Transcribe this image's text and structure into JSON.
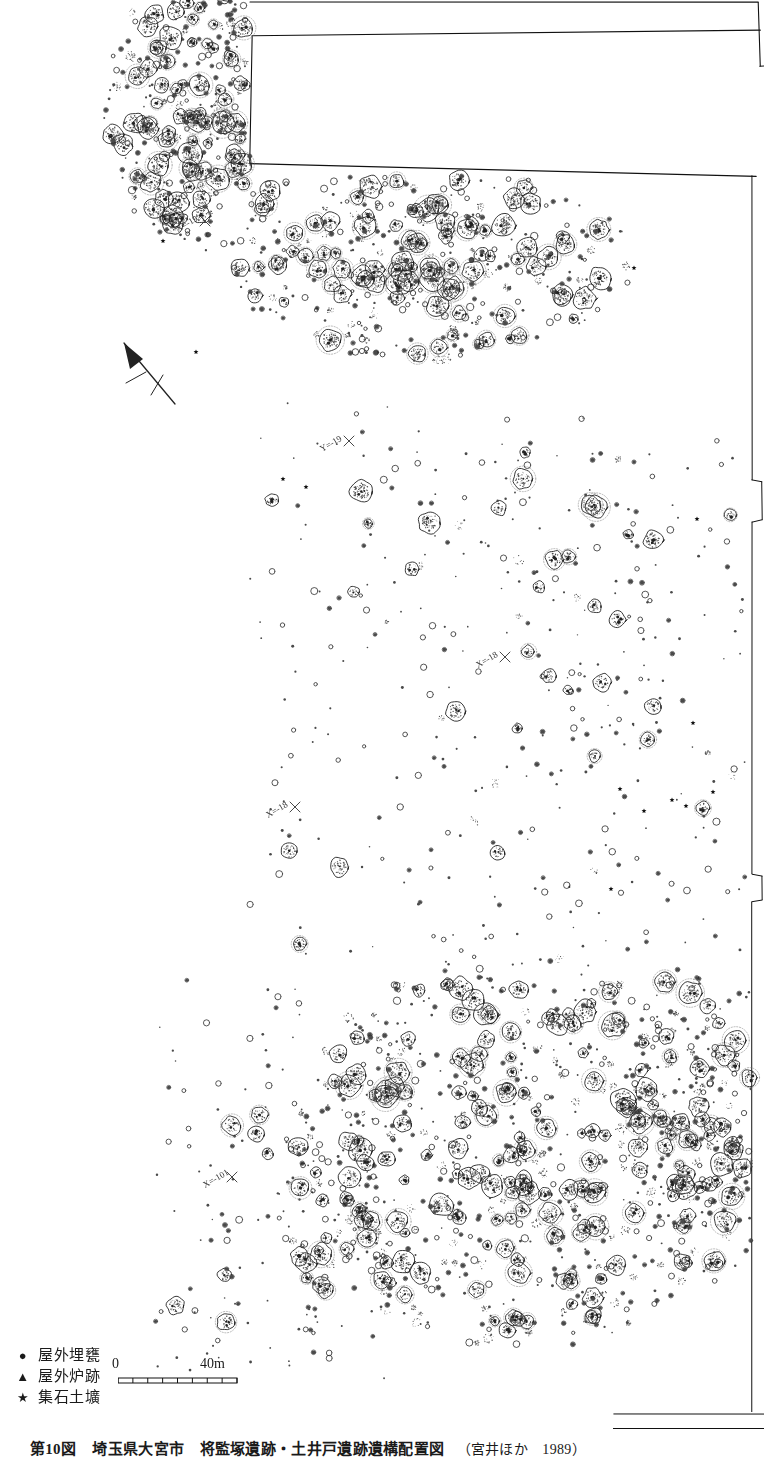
{
  "figure": {
    "number_label": "第10図",
    "title": "埼玉県大宮市　将監塚遺跡・土井戸遺跡遺構配置図",
    "source": "（宮井ほか　1989）"
  },
  "legend": {
    "items": [
      {
        "symbol": "●",
        "icon": "filled-circle-icon",
        "label": "屋外埋甕"
      },
      {
        "symbol": "▲",
        "icon": "filled-triangle-icon",
        "label": "屋外炉跡"
      },
      {
        "symbol": "★",
        "icon": "filled-star-icon",
        "label": "集石土壙"
      }
    ]
  },
  "scale_bar": {
    "min_label": "0",
    "max_label": "40m",
    "unit": "m",
    "length_meters": 40,
    "ticks": 8
  },
  "north_arrow": {
    "label": "N",
    "bearing_deg": -23
  },
  "grid_labels": [
    {
      "text": "X=-19",
      "x": 178,
      "y": 232,
      "rot": -30
    },
    {
      "text": "Y=-19",
      "x": 322,
      "y": 452,
      "rot": -30
    },
    {
      "text": "X=-18",
      "x": 478,
      "y": 668,
      "rot": -30
    },
    {
      "text": "X=-18",
      "x": 268,
      "y": 818,
      "rot": -30
    },
    {
      "text": "X=-101",
      "x": 205,
      "y": 1188,
      "rot": -30
    }
  ],
  "map": {
    "name": "将監塚・土井戸遺跡　遺構配置図",
    "description": "縄文時代集落遺跡の遺構配置図。竪穴住居跡・ピット群の分布を示す。",
    "canvas": {
      "width": 764,
      "height": 1420
    },
    "colors": {
      "ink": "#222222",
      "boundary": "#111111",
      "paper": "#ffffff",
      "stipple": "#4a4a4a"
    },
    "excavation_boundary": {
      "type": "polyline",
      "points": "248,4 248,166 752,176 752,1412"
    },
    "unexcavated_block": {
      "label": "",
      "points": "252,8 760,4 760,62 756,172 252,164"
    },
    "feature_clusters": [
      {
        "name": "north-west-cluster",
        "cx": 205,
        "cy": 110,
        "rx": 95,
        "ry": 130,
        "density": 1.0,
        "pit_count": 78,
        "post_count": 260
      },
      {
        "name": "north-central-cluster",
        "cx": 430,
        "cy": 265,
        "rx": 190,
        "ry": 90,
        "density": 0.95,
        "pit_count": 86,
        "post_count": 300
      },
      {
        "name": "mid-sparse-zone",
        "cx": 520,
        "cy": 560,
        "rx": 200,
        "ry": 140,
        "density": 0.14,
        "pit_count": 12,
        "post_count": 55
      },
      {
        "name": "mid-south-sparse",
        "cx": 590,
        "cy": 760,
        "rx": 150,
        "ry": 120,
        "density": 0.1,
        "pit_count": 6,
        "post_count": 40
      },
      {
        "name": "south-main-cluster",
        "cx": 520,
        "cy": 1150,
        "rx": 215,
        "ry": 185,
        "density": 1.0,
        "pit_count": 150,
        "post_count": 560
      },
      {
        "name": "south-east-fringe",
        "cx": 700,
        "cy": 1120,
        "rx": 70,
        "ry": 160,
        "density": 0.55,
        "pit_count": 34,
        "post_count": 120
      },
      {
        "name": "south-west-fringe",
        "cx": 300,
        "cy": 1250,
        "rx": 80,
        "ry": 110,
        "density": 0.22,
        "pit_count": 14,
        "post_count": 45
      }
    ],
    "symbol_markers": [
      {
        "type": "star",
        "x": 634,
        "y": 268
      },
      {
        "type": "star",
        "x": 697,
        "y": 519
      },
      {
        "type": "star",
        "x": 693,
        "y": 723
      },
      {
        "type": "star",
        "x": 672,
        "y": 800
      },
      {
        "type": "star",
        "x": 686,
        "y": 806
      },
      {
        "type": "star",
        "x": 713,
        "y": 792
      },
      {
        "type": "star",
        "x": 620,
        "y": 789
      },
      {
        "type": "star",
        "x": 644,
        "y": 811
      },
      {
        "type": "star",
        "x": 611,
        "y": 889
      },
      {
        "type": "star",
        "x": 163,
        "y": 241
      },
      {
        "type": "star",
        "x": 196,
        "y": 352
      },
      {
        "type": "star",
        "x": 283,
        "y": 479
      },
      {
        "type": "star",
        "x": 306,
        "y": 487
      }
    ]
  }
}
